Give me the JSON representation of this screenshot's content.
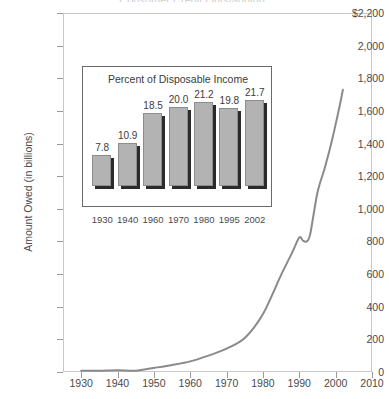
{
  "title": "Consumer Credit Outstanding",
  "chart_data": {
    "type": "line",
    "title": "Consumer Credit Outstanding",
    "xlabel": "",
    "ylabel": "Amount Owed (in billions)",
    "xlim": [
      1925,
      2010
    ],
    "ylim": [
      0,
      2200
    ],
    "grid": false,
    "legend": null,
    "y_ticks": [
      "$2,200",
      "2,000",
      "1,800",
      "1,600",
      "1,400",
      "1,200",
      "1,000",
      "800",
      "600",
      "400",
      "200",
      "0"
    ],
    "y_tick_values": [
      2200,
      2000,
      1800,
      1600,
      1400,
      1200,
      1000,
      800,
      600,
      400,
      200,
      0
    ],
    "x_ticks": [
      "1930",
      "1940",
      "1950",
      "1960",
      "1970",
      "1980",
      "1990",
      "2000",
      "2010"
    ],
    "x_tick_values": [
      1930,
      1940,
      1950,
      1960,
      1970,
      1980,
      1990,
      2000,
      2010
    ],
    "line_color": "#8a8a8a",
    "x": [
      1930,
      1935,
      1940,
      1945,
      1950,
      1955,
      1960,
      1965,
      1970,
      1975,
      1980,
      1985,
      1988,
      1990,
      1991,
      1992,
      1993,
      1995,
      1997,
      1999,
      2001,
      2002
    ],
    "values": [
      7,
      8,
      11,
      8,
      25,
      43,
      65,
      100,
      143,
      208,
      355,
      595,
      730,
      825,
      805,
      800,
      845,
      1100,
      1250,
      1420,
      1620,
      1730
    ],
    "annotations": []
  },
  "inset": {
    "chart_data": {
      "type": "bar",
      "title": "Percent of Disposable Income",
      "xlabel": "",
      "ylabel": "",
      "ylim": [
        0,
        24
      ],
      "grid": false,
      "bar_color": "#b3b3b3",
      "categories": [
        "1930",
        "1940",
        "1960",
        "1970",
        "1980",
        "1995",
        "2002"
      ],
      "values": [
        7.8,
        10.9,
        18.5,
        20.0,
        21.2,
        19.8,
        21.7
      ],
      "value_labels": [
        "7.8",
        "10.9",
        "18.5",
        "20.0",
        "21.2",
        "19.8",
        "21.7"
      ]
    }
  }
}
